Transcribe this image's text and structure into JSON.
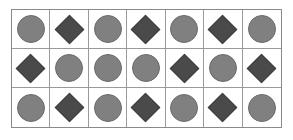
{
  "figure": {
    "name": "shape-grid",
    "columns": 7,
    "rows": 3,
    "background_color": "#ffffff",
    "border_color": "#8a8a8a",
    "cell_border_color": "#9a9a9a"
  },
  "shape_types": {
    "circle": {
      "label": "circle",
      "fill_color": "#808080",
      "stroke_color": "#6b6b6b"
    },
    "diamond": {
      "label": "diamond",
      "fill_color": "#4a4a4a",
      "stroke_color": "#3d3d3d"
    }
  },
  "grid": {
    "rows": [
      {
        "index": 1,
        "cells": [
          "circle",
          "diamond",
          "circle",
          "diamond",
          "circle",
          "diamond",
          "circle"
        ]
      },
      {
        "index": 2,
        "cells": [
          "diamond",
          "circle",
          "circle",
          "circle",
          "diamond",
          "circle",
          "diamond"
        ]
      },
      {
        "index": 3,
        "cells": [
          "circle",
          "diamond",
          "circle",
          "diamond",
          "circle",
          "diamond",
          "circle"
        ]
      }
    ]
  },
  "counts": {
    "total_cells": 21,
    "circles": 12,
    "diamonds": 9
  }
}
